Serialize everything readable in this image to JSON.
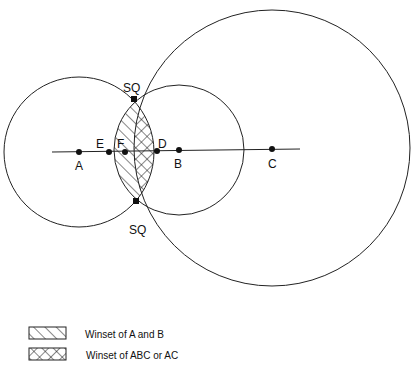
{
  "diagram": {
    "points": {
      "A": {
        "label": "A",
        "x": 79,
        "y": 152
      },
      "E": {
        "label": "E",
        "x": 109,
        "y": 152
      },
      "F": {
        "label": "F",
        "x": 125,
        "y": 152
      },
      "D": {
        "label": "D",
        "x": 157,
        "y": 151
      },
      "B": {
        "label": "B",
        "x": 179,
        "y": 150
      },
      "C": {
        "label": "C",
        "x": 272,
        "y": 149
      },
      "SQ_top": {
        "label": "SQ",
        "x": 134,
        "y": 99
      },
      "SQ_bottom": {
        "label": "SQ",
        "x": 136,
        "y": 201
      }
    },
    "circles": [
      {
        "name": "circle-a",
        "cx": 79,
        "cy": 152,
        "r": 75
      },
      {
        "name": "circle-b",
        "cx": 179,
        "cy": 150,
        "r": 65
      },
      {
        "name": "circle-c",
        "cx": 272,
        "cy": 148,
        "r": 138
      }
    ]
  },
  "legend": {
    "items": [
      {
        "pattern": "single-hatch",
        "label": "Winset of A and B"
      },
      {
        "pattern": "cross-hatch",
        "label": "Winset of ABC or AC"
      }
    ]
  }
}
